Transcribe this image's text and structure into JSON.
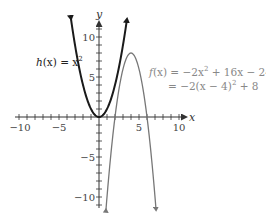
{
  "chart_data": {
    "type": "line",
    "title": "",
    "xlabel": "x",
    "ylabel": "y",
    "xlim": [
      -10.5,
      11.5
    ],
    "ylim": [
      -11.5,
      12
    ],
    "grid": false,
    "x_tick_labels": [
      "−10",
      "−5",
      "5",
      "10"
    ],
    "x_tick_values": [
      -10,
      -5,
      5,
      10
    ],
    "y_tick_labels": [
      "10",
      "5",
      "−5",
      "−10"
    ],
    "y_tick_values": [
      10,
      5,
      -5,
      -10
    ],
    "series": [
      {
        "name": "h(x) = x^2",
        "expression": "x^2",
        "color": "#1a1a1a",
        "x_range": [
          -3.5,
          3.5
        ],
        "points": [
          [
            -3.5,
            12.25
          ],
          [
            -3,
            9
          ],
          [
            -2,
            4
          ],
          [
            -1,
            1
          ],
          [
            0,
            0
          ],
          [
            1,
            1
          ],
          [
            2,
            4
          ],
          [
            3,
            9
          ],
          [
            3.5,
            12.25
          ]
        ],
        "label_lines": [
          "h(x) = x²"
        ]
      },
      {
        "name": "f(x) = −2x² + 16x − 24",
        "expression": "-2x^2 + 16x - 24",
        "vertex_form": "-2(x - 4)^2 + 8",
        "color": "#777777",
        "x_range": [
          1.55,
          6.45
        ],
        "vertex": [
          4,
          8
        ],
        "points": [
          [
            1.55,
            -4
          ],
          [
            2,
            0
          ],
          [
            3,
            6
          ],
          [
            4,
            8
          ],
          [
            5,
            6
          ],
          [
            6,
            0
          ],
          [
            6.45,
            -4
          ]
        ],
        "label_lines": [
          "f(x) = −2x² + 16x − 24",
          "= −2(x − 4)² + 8"
        ]
      }
    ]
  },
  "labels": {
    "h_prefix": "h",
    "h_arg": "(x) = x",
    "h_sup": "2",
    "f_line1_prefix": "f",
    "f_line1_rest": "(x) = −2x",
    "f_line1_sup": "2",
    "f_line1_tail": " + 16x − 24",
    "f_line2_lead": "= −2(x − 4)",
    "f_line2_sup": "2",
    "f_line2_tail": " + 8",
    "x_axis": "x",
    "y_axis": "y",
    "xt_m10": "−10",
    "xt_m5": "−5",
    "xt_5": "5",
    "xt_10": "10",
    "yt_10": "10",
    "yt_5": "5",
    "yt_m5": "−5",
    "yt_m10": "−10"
  },
  "style": {
    "h_color": "#1a1a1a",
    "f_color": "#7a7a7a",
    "axis_color": "#333333"
  }
}
